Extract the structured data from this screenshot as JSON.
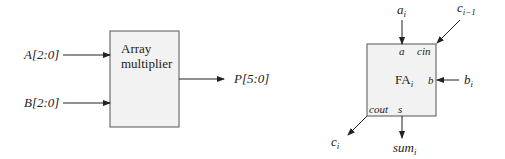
{
  "left_diagram": {
    "block_label_line1": "Array",
    "block_label_line2": "multiplier",
    "input_a": "A[2:0]",
    "input_b": "B[2:0]",
    "output_p": "P[5:0]"
  },
  "right_diagram": {
    "block_label": "FA",
    "block_label_sub": "i",
    "port_a": "a",
    "port_cin": "cin",
    "port_b": "b",
    "port_cout": "cout",
    "port_s": "s",
    "signal_ai": "a",
    "signal_ai_sub": "i",
    "signal_ci_minus_1": "c",
    "signal_ci_minus_1_sub": "i−1",
    "signal_bi": "b",
    "signal_bi_sub": "i",
    "signal_ci": "c",
    "signal_ci_sub": "i",
    "signal_sumi": "sum",
    "signal_sumi_sub": "i"
  },
  "colors": {
    "block_fill": "#f2f2f2",
    "stroke": "#333333"
  }
}
